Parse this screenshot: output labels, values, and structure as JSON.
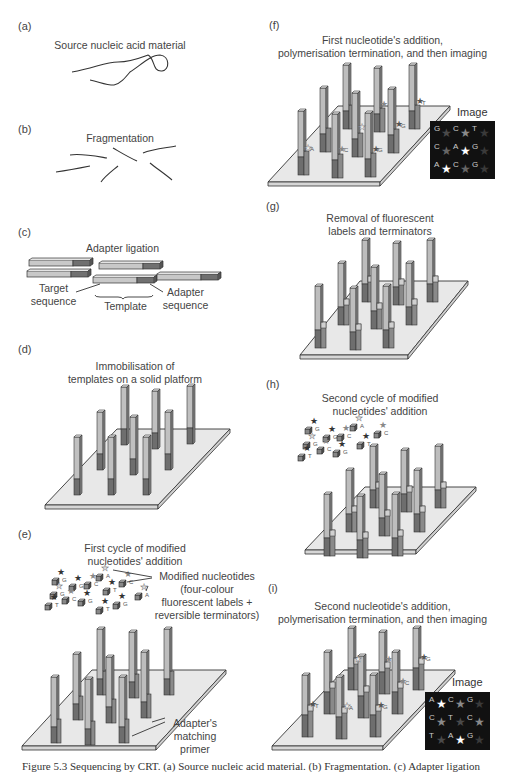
{
  "figure": {
    "caption": "Figure 5.3  Sequencing by CRT. (a) Source nucleic acid material. (b) Fragmentation. (c) Adapter ligation",
    "panels": {
      "a": {
        "label": "(a)",
        "title": "Source nucleic acid material"
      },
      "b": {
        "label": "(b)",
        "title": "Fragmentation"
      },
      "c": {
        "label": "(c)",
        "title": "Adapter ligation",
        "annotations": {
          "target": "Target\nsequence",
          "template": "Template",
          "adapter": "Adapter\nsequence"
        }
      },
      "d": {
        "label": "(d)",
        "title": "Immobilisation of\ntemplates on a solid platform"
      },
      "e": {
        "label": "(e)",
        "title": "First cycle of modified\nnucleotides' addition",
        "annotations": {
          "modified": "Modified nucleotides\n(four-colour\nfluorescent labels +\nreversible terminators)",
          "primer": "Adapter's\nmatching\nprimer"
        },
        "nucleotides": [
          "G",
          "A",
          "G",
          "C",
          "C",
          "A",
          "T",
          "C",
          "G",
          "T",
          "G",
          "T",
          "G",
          "A"
        ]
      },
      "f": {
        "label": "(f)",
        "title": "First nucleotide's addition,\npolymerisation termination, and then imaging",
        "image_label": "Image",
        "image_grid": [
          [
            "G",
            "C",
            "T"
          ],
          [
            "C",
            "A",
            "G"
          ],
          [
            "A",
            "C",
            "G"
          ]
        ],
        "bases_on_posts": [
          "A",
          "C",
          "G",
          "G",
          "T"
        ]
      },
      "g": {
        "label": "(g)",
        "title": "Removal of fluorescent\nlabels and terminators"
      },
      "h": {
        "label": "(h)",
        "title": "Second cycle of modified\nnucleotides' addition",
        "nucleotides": [
          "G",
          "G",
          "C",
          "A",
          "C",
          "C",
          "T",
          "G",
          "T",
          "G"
        ]
      },
      "i": {
        "label": "(i)",
        "title": "Second nucleotide's addition,\npolymerisation termination, and then imaging",
        "image_label": "Image",
        "image_grid": [
          [
            "A",
            "C",
            "G"
          ],
          [
            "C",
            "T",
            "C"
          ],
          [
            "T",
            "A",
            "G"
          ]
        ],
        "bases_on_posts": [
          "T",
          "A",
          "G",
          "C",
          "G"
        ]
      }
    },
    "colors": {
      "post_light": "#b8b8b8",
      "post_dark": "#6e6e6e",
      "platform": "#e6e6e6",
      "image_bg": "#111111",
      "star_bright": "#ffffff",
      "star_mid": "#8a8a8a",
      "star_dim": "#4a4a4a"
    }
  }
}
